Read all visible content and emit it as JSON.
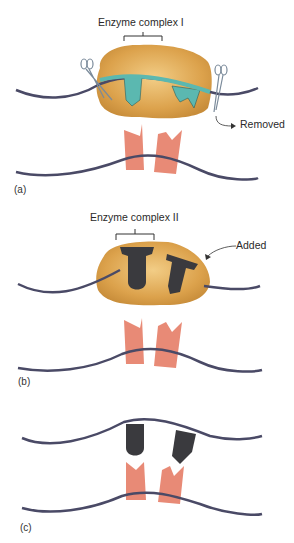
{
  "panels": [
    {
      "id": "a",
      "label": "(a)",
      "complex_label": "Enzyme complex I",
      "annotation": "Removed",
      "enzyme_subunit_color": "#5bb8b0",
      "tools": [
        "scissors-icon",
        "scissors-icon"
      ]
    },
    {
      "id": "b",
      "label": "(b)",
      "complex_label": "Enzyme complex II",
      "annotation": "Added",
      "enzyme_subunit_color": "#3a3a3e"
    },
    {
      "id": "c",
      "label": "(c)",
      "enzyme_subunit_color": "#3a3a3e"
    }
  ],
  "colors": {
    "complex_body": "#d9a24a",
    "complex_body_light": "#efc77a",
    "strand": "#4a4a66",
    "substrate": "#e88a76",
    "background": "#ffffff"
  }
}
